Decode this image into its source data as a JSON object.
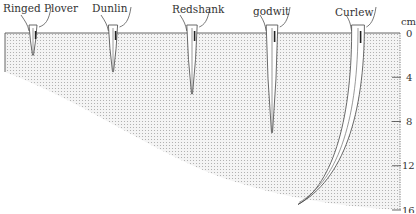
{
  "diagram": {
    "unit": "cm",
    "depth_scale": {
      "ticks": [
        0,
        4,
        8,
        12,
        16
      ],
      "range": [
        0,
        16
      ]
    },
    "birds": [
      {
        "name": "Ringed Plover",
        "probe_depth_cm": 2
      },
      {
        "name": "Dunlin",
        "probe_depth_cm": 3.5
      },
      {
        "name": "Redshank",
        "probe_depth_cm": 5.5
      },
      {
        "name": "godwit",
        "probe_depth_cm": 9
      },
      {
        "name": "Curlew",
        "probe_depth_cm": 15.5
      }
    ],
    "colors": {
      "mud_dots": "#9a9a9a",
      "outline": "#444444",
      "text": "#333333"
    }
  }
}
